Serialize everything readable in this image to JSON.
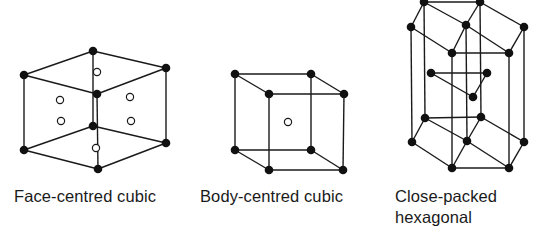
{
  "figure": {
    "colors": {
      "line": "#1a1a1a",
      "atom_fill": "#111111",
      "open_atom_fill": "#ffffff",
      "background": "#ffffff"
    },
    "structures": [
      {
        "id": "fcc",
        "label": "Face-centred cubic",
        "atoms_closed": [
          [
            93,
            51
          ],
          [
            24,
            75
          ],
          [
            166,
            68
          ],
          [
            97,
            94
          ],
          [
            93,
            126
          ],
          [
            24,
            150
          ],
          [
            166,
            143
          ],
          [
            98,
            169
          ]
        ],
        "atoms_open": [
          [
            97,
            72
          ],
          [
            60,
            100
          ],
          [
            130,
            97
          ],
          [
            61,
            121
          ],
          [
            131,
            121
          ],
          [
            96,
            148
          ]
        ],
        "edges": [
          [
            0,
            1
          ],
          [
            0,
            2
          ],
          [
            1,
            3
          ],
          [
            2,
            3
          ],
          [
            1,
            5
          ],
          [
            2,
            6
          ],
          [
            3,
            7
          ],
          [
            5,
            7
          ],
          [
            6,
            7
          ],
          [
            4,
            5
          ],
          [
            4,
            6
          ],
          [
            0,
            4
          ]
        ]
      },
      {
        "id": "bcc",
        "label": "Body-centred cubic",
        "atoms_closed": [
          [
            235,
            74
          ],
          [
            311,
            74
          ],
          [
            269,
            94
          ],
          [
            344,
            94
          ],
          [
            235,
            150
          ],
          [
            311,
            150
          ],
          [
            269,
            170
          ],
          [
            343,
            170
          ]
        ],
        "atoms_open": [
          [
            288,
            122
          ]
        ],
        "edges": [
          [
            0,
            1
          ],
          [
            0,
            2
          ],
          [
            1,
            3
          ],
          [
            2,
            3
          ],
          [
            4,
            5
          ],
          [
            4,
            6
          ],
          [
            5,
            7
          ],
          [
            6,
            7
          ],
          [
            0,
            4
          ],
          [
            1,
            5
          ],
          [
            2,
            6
          ],
          [
            3,
            7
          ]
        ]
      },
      {
        "id": "hcp",
        "label_line1": "Close-packed",
        "label_line2": "hexagonal",
        "atoms_closed": [
          [
            424,
            2
          ],
          [
            480,
            2
          ],
          [
            411,
            27
          ],
          [
            466,
            25
          ],
          [
            524,
            27
          ],
          [
            452,
            53
          ],
          [
            509,
            53
          ],
          [
            431,
            73
          ],
          [
            487,
            73
          ],
          [
            473,
            97
          ],
          [
            425,
            118
          ],
          [
            481,
            117
          ],
          [
            412,
            142
          ],
          [
            467,
            141
          ],
          [
            524,
            142
          ],
          [
            452,
            168
          ],
          [
            509,
            168
          ]
        ],
        "atoms_open": [],
        "edges": [
          [
            0,
            1
          ],
          [
            0,
            2
          ],
          [
            1,
            3
          ],
          [
            1,
            4
          ],
          [
            0,
            3
          ],
          [
            2,
            5
          ],
          [
            3,
            5
          ],
          [
            3,
            6
          ],
          [
            4,
            6
          ],
          [
            5,
            6
          ],
          [
            7,
            8
          ],
          [
            7,
            9
          ],
          [
            8,
            9
          ],
          [
            10,
            11
          ],
          [
            10,
            12
          ],
          [
            11,
            13
          ],
          [
            11,
            14
          ],
          [
            10,
            13
          ],
          [
            12,
            15
          ],
          [
            13,
            15
          ],
          [
            13,
            16
          ],
          [
            14,
            16
          ],
          [
            15,
            16
          ],
          [
            0,
            10
          ],
          [
            1,
            11
          ],
          [
            2,
            12
          ],
          [
            3,
            13
          ],
          [
            4,
            14
          ],
          [
            5,
            15
          ],
          [
            6,
            16
          ]
        ]
      }
    ]
  }
}
